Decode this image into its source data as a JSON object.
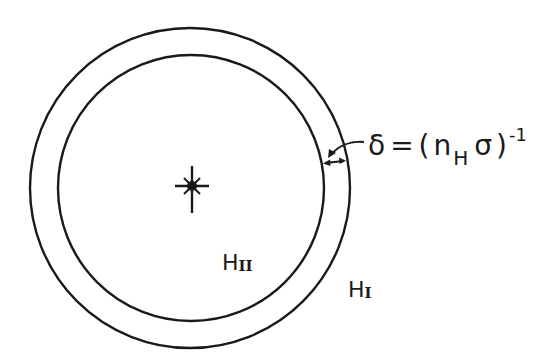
{
  "diagram": {
    "type": "stromgren-sphere",
    "colors": {
      "background": "#ffffff",
      "ink": "#1a1a1a"
    },
    "outer_circle": {
      "cx": 190,
      "cy": 188,
      "r": 160
    },
    "inner_circle": {
      "cx": 191,
      "cy": 188,
      "r": 133
    },
    "star": {
      "cx": 192,
      "cy": 186,
      "icon": "star-icon"
    },
    "regions": {
      "ionized": {
        "prefix": "H",
        "numeral": "II"
      },
      "neutral": {
        "prefix": "H",
        "numeral": "I"
      }
    },
    "thickness_label": {
      "symbol": "δ",
      "equals": "=",
      "open_paren": "(",
      "n": "n",
      "subscript": "H",
      "sigma": "σ",
      "close_paren": ")",
      "superscript": "-1"
    }
  }
}
